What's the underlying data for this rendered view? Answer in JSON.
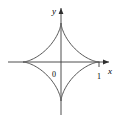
{
  "figure": {
    "title": "",
    "background_color": "#ffffff",
    "width": 118,
    "height": 122
  },
  "labels": {
    "x_axis": "x",
    "y_axis": "y",
    "origin": "0",
    "x_tick_one": "1"
  },
  "colors": {
    "axis": "#3a3a3a",
    "curve": "#555555",
    "text": "#1a1a1a",
    "background": "#ffffff"
  },
  "chart_data": {
    "type": "line",
    "title": "",
    "xlabel": "x",
    "ylabel": "y",
    "curve_name": "astroid",
    "equation": "x^(2/3) + y^(2/3) = 1",
    "parametric": {
      "x": "cos(t)^3",
      "y": "sin(t)^3",
      "t_range": [
        0,
        6.283185307179586
      ]
    },
    "xlim": [
      -1.4,
      1.4
    ],
    "ylim": [
      -1.4,
      1.4
    ],
    "grid": false,
    "legend": false,
    "xticks": [
      1
    ],
    "xticklabels": [
      "1"
    ],
    "yticks": [],
    "yticklabels": [],
    "annotations": [
      {
        "text": "0",
        "x": -0.1,
        "y": -0.14
      },
      {
        "text": "1",
        "x": 1.0,
        "y": -0.2
      },
      {
        "text": "x",
        "x": 1.35,
        "y": -0.12
      },
      {
        "text": "y",
        "x": -0.12,
        "y": 1.38
      }
    ],
    "cusps": [
      {
        "x": 1,
        "y": 0
      },
      {
        "x": 0,
        "y": 1
      },
      {
        "x": -1,
        "y": 0
      },
      {
        "x": 0,
        "y": -1
      }
    ],
    "x": [
      1.0,
      0.9325,
      0.7442,
      0.4871,
      0.2242,
      0.0329,
      0.0,
      0.0329,
      0.2242,
      0.4871,
      0.7442,
      0.9325,
      1.0,
      0.9325,
      0.7442,
      0.4871,
      0.2242,
      0.0329,
      0.0,
      -0.0329,
      -0.2242,
      -0.4871,
      -0.7442,
      -0.9325,
      -1.0,
      -0.9325,
      -0.7442,
      -0.4871,
      -0.2242,
      -0.0329,
      0.0,
      0.0329,
      0.2242,
      0.4871,
      0.7442,
      0.9325,
      1.0
    ],
    "y": [
      0.0,
      0.0329,
      0.2242,
      0.4871,
      0.7442,
      0.9325,
      1.0,
      0.9325,
      0.7442,
      0.4871,
      0.2242,
      0.0329,
      0.0,
      -0.0329,
      -0.2242,
      -0.4871,
      -0.7442,
      -0.9325,
      -1.0,
      -0.9325,
      -0.7442,
      -0.4871,
      -0.2242,
      -0.0329,
      0.0,
      0.0329,
      0.2242,
      0.4871,
      0.7442,
      0.9325,
      1.0,
      0.9325,
      0.7442,
      0.4871,
      0.2242,
      0.0329,
      0.0
    ]
  }
}
